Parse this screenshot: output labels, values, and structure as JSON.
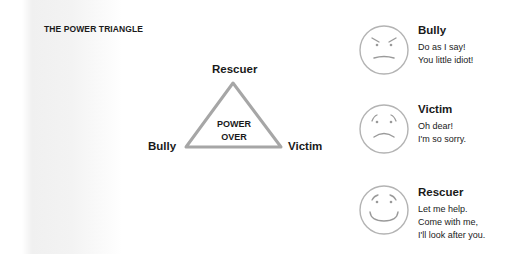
{
  "title": "THE POWER TRIANGLE",
  "triangle": {
    "top_label": "Rescuer",
    "left_label": "Bully",
    "right_label": "Victim",
    "center_lines": [
      "POWER",
      "OVER"
    ],
    "stroke_color": "#a6a6a6"
  },
  "roles": [
    {
      "name": "Bully",
      "face": "angry-face-icon",
      "lines": [
        "Do as I say!",
        "You little idiot!"
      ]
    },
    {
      "name": "Victim",
      "face": "sad-face-icon",
      "lines": [
        "Oh dear!",
        "I'm so sorry."
      ]
    },
    {
      "name": "Rescuer",
      "face": "smiling-face-icon",
      "lines": [
        "Let me help.",
        "Come with me,",
        "I'll look after you."
      ]
    }
  ]
}
